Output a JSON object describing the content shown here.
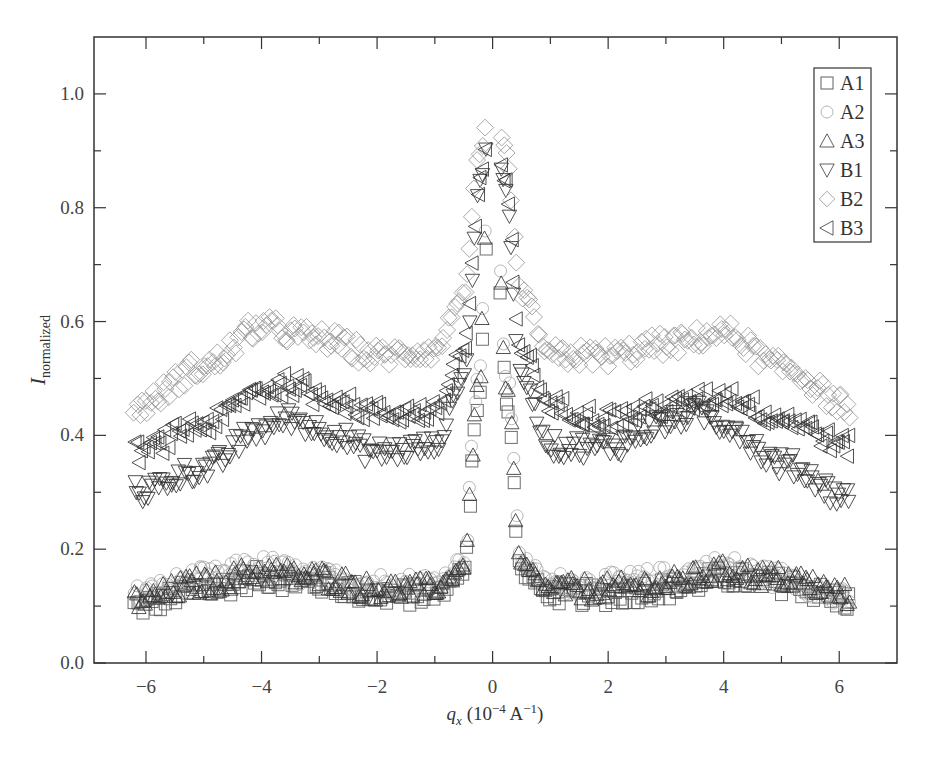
{
  "chart_data": {
    "type": "scatter",
    "title": "",
    "xlabel": "q_x (10^-4 A^-1)",
    "ylabel": "I_normalized",
    "xlim": [
      -6.9,
      7.0
    ],
    "ylim": [
      0.0,
      1.1
    ],
    "xticks": [
      -6,
      -4,
      -2,
      0,
      2,
      4,
      6
    ],
    "xtick_labels": [
      "−6",
      "−4",
      "−2",
      "0",
      "2",
      "4",
      "6"
    ],
    "xminor_ticks": [
      -5,
      -3,
      -1,
      1,
      3,
      5
    ],
    "yticks": [
      0.0,
      0.2,
      0.4,
      0.6,
      0.8,
      1.0
    ],
    "ytick_labels": [
      "0.0",
      "0.2",
      "0.4",
      "0.6",
      "0.8",
      "1.0"
    ],
    "yminor_ticks": [
      0.1,
      0.3,
      0.5,
      0.7,
      0.9
    ],
    "grid": false,
    "legend_position": "upper right",
    "series": [
      {
        "name": "A1",
        "marker": "square",
        "color": "#555555",
        "profile": {
          "x": [
            -6.2,
            -5,
            -4,
            -3,
            -2,
            -1,
            -0.5,
            -0.25,
            0,
            0.25,
            0.5,
            1,
            2,
            3,
            4,
            5,
            6.2
          ],
          "y": [
            0.1,
            0.13,
            0.15,
            0.14,
            0.12,
            0.12,
            0.16,
            0.45,
            1.0,
            0.45,
            0.16,
            0.12,
            0.12,
            0.13,
            0.15,
            0.14,
            0.11
          ]
        }
      },
      {
        "name": "A2",
        "marker": "circle",
        "color": "#aaaaaa",
        "profile": {
          "x": [
            -6.2,
            -5,
            -4,
            -3,
            -2,
            -1,
            -0.5,
            -0.25,
            0,
            0.25,
            0.5,
            1,
            2,
            3,
            4,
            5,
            6.2
          ],
          "y": [
            0.12,
            0.15,
            0.17,
            0.15,
            0.14,
            0.14,
            0.18,
            0.5,
            1.0,
            0.5,
            0.18,
            0.14,
            0.14,
            0.15,
            0.17,
            0.15,
            0.11
          ]
        }
      },
      {
        "name": "A3",
        "marker": "triangle-up",
        "color": "#333333",
        "profile": {
          "x": [
            -6.2,
            -5,
            -4,
            -3,
            -2,
            -1,
            -0.5,
            -0.25,
            0,
            0.25,
            0.5,
            1,
            2,
            3,
            4,
            5,
            6.2
          ],
          "y": [
            0.11,
            0.14,
            0.16,
            0.15,
            0.13,
            0.13,
            0.17,
            0.48,
            1.0,
            0.48,
            0.17,
            0.13,
            0.13,
            0.14,
            0.16,
            0.15,
            0.12
          ]
        }
      },
      {
        "name": "B1",
        "marker": "triangle-down",
        "color": "#333333",
        "profile": {
          "x": [
            -6.2,
            -5,
            -4,
            -3.5,
            -3,
            -2,
            -1,
            -0.5,
            -0.2,
            0,
            0.2,
            0.5,
            1,
            2,
            3,
            3.5,
            4,
            5,
            6.2
          ],
          "y": [
            0.3,
            0.34,
            0.41,
            0.43,
            0.41,
            0.37,
            0.38,
            0.5,
            0.85,
            1.0,
            0.85,
            0.5,
            0.38,
            0.38,
            0.42,
            0.44,
            0.42,
            0.35,
            0.29
          ]
        }
      },
      {
        "name": "B2",
        "marker": "diamond",
        "color": "#999999",
        "profile": {
          "x": [
            -6.2,
            -5,
            -4,
            -3,
            -2,
            -1,
            -0.5,
            -0.2,
            0,
            0.2,
            0.5,
            1,
            2,
            3,
            4,
            5,
            6.2
          ],
          "y": [
            0.45,
            0.52,
            0.59,
            0.57,
            0.54,
            0.55,
            0.65,
            0.9,
            1.0,
            0.9,
            0.65,
            0.54,
            0.54,
            0.56,
            0.58,
            0.52,
            0.45
          ]
        }
      },
      {
        "name": "B3",
        "marker": "triangle-left",
        "color": "#333333",
        "profile": {
          "x": [
            -6.2,
            -5,
            -4,
            -3.5,
            -3,
            -2,
            -1,
            -0.5,
            -0.2,
            0,
            0.2,
            0.5,
            1,
            2,
            3,
            4,
            5,
            6.2
          ],
          "y": [
            0.37,
            0.42,
            0.48,
            0.49,
            0.47,
            0.44,
            0.44,
            0.55,
            0.85,
            1.0,
            0.85,
            0.55,
            0.45,
            0.43,
            0.45,
            0.47,
            0.43,
            0.38
          ]
        }
      }
    ]
  },
  "axes": {
    "xlabel_main": "q",
    "xlabel_sub": "x",
    "xlabel_units": " (10",
    "xlabel_exp1": "−4",
    "xlabel_mid": " A",
    "xlabel_exp2": "−1",
    "xlabel_close": ")",
    "ylabel_main": "I",
    "ylabel_sub": "normalized"
  },
  "legend": {
    "items": [
      {
        "label": "A1",
        "marker": "square"
      },
      {
        "label": "A2",
        "marker": "circle"
      },
      {
        "label": "A3",
        "marker": "triangle-up"
      },
      {
        "label": "B1",
        "marker": "triangle-down"
      },
      {
        "label": "B2",
        "marker": "diamond"
      },
      {
        "label": "B3",
        "marker": "triangle-left"
      }
    ]
  }
}
